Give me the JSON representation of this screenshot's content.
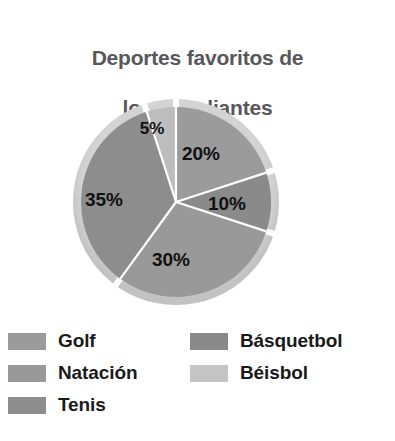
{
  "chart_data": {
    "type": "pie",
    "title": "Deportes favoritos de\nlos estudiantes",
    "categories": [
      "Golf",
      "Básquetbol",
      "Natación",
      "Tenis",
      "Béisbol"
    ],
    "values": [
      20,
      10,
      30,
      35,
      5
    ],
    "value_labels": [
      "20%",
      "10%",
      "30%",
      "35%",
      "5%"
    ],
    "unit": "%",
    "total": 100,
    "legend_position": "bottom",
    "grid": false,
    "start_angle_deg": 0,
    "direction": "clockwise",
    "slices": [
      {
        "name": "Golf",
        "label": "20%",
        "value": 20,
        "color": "#9b9b9b",
        "rim_color": "#c9c9c9",
        "start_deg": 0,
        "end_deg": 72,
        "label_x": 154,
        "label_y": 62
      },
      {
        "name": "Básquetbol",
        "label": "10%",
        "value": 10,
        "color": "#8a8a8a",
        "rim_color": "#bdbdbd",
        "start_deg": 72,
        "end_deg": 108,
        "label_x": 178,
        "label_y": 110
      },
      {
        "name": "Natación",
        "label": "30%",
        "value": 30,
        "color": "#999999",
        "rim_color": "#c7c7c7",
        "start_deg": 108,
        "end_deg": 216,
        "label_x": 121,
        "label_y": 166
      },
      {
        "name": "Tenis",
        "label": "35%",
        "value": 35,
        "color": "#8d8d8d",
        "rim_color": "#bfbfbf",
        "start_deg": 216,
        "end_deg": 342,
        "label_x": 57,
        "label_y": 106
      },
      {
        "name": "Béisbol",
        "label": "5%",
        "value": 5,
        "color": "#bdbdbd",
        "rim_color": "#d6d6d6",
        "start_deg": 342,
        "end_deg": 360,
        "label_x": 103,
        "label_y": 32
      }
    ]
  },
  "title": {
    "line1": "Deportes favoritos de",
    "line2": "los estudiantes",
    "color": "#58585a"
  },
  "labels": {
    "golf": "20%",
    "basquetbol": "10%",
    "natacion": "30%",
    "tenis": "35%",
    "beisbol": "5%"
  },
  "legend": {
    "left_column": [
      {
        "label": "Golf",
        "color": "#9b9b9b"
      },
      {
        "label": "Natación",
        "color": "#999999"
      },
      {
        "label": "Tenis",
        "color": "#8d8d8d"
      }
    ],
    "right_column": [
      {
        "label": "Básquetbol",
        "color": "#8a8a8a"
      },
      {
        "label": "Béisbol",
        "color": "#c5c5c5"
      }
    ]
  },
  "colors": {
    "background": "#ffffff",
    "title_gray": "#58585a",
    "label_black": "#111111",
    "legend_text": "#1a1a1a",
    "rim_light": "#cccccc",
    "separator": "#ffffff"
  }
}
